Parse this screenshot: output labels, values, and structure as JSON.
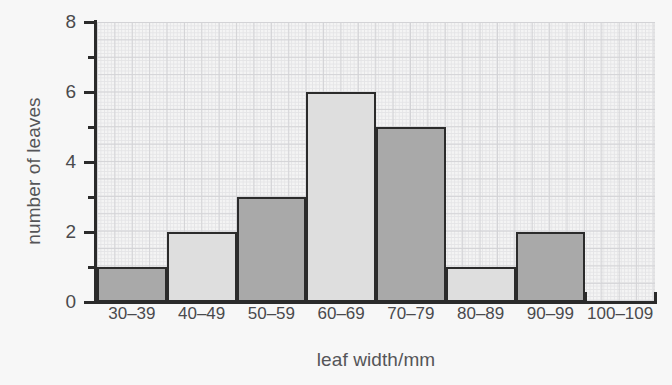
{
  "chart_data": {
    "type": "bar",
    "title": "",
    "subtitle": "",
    "xlabel": "leaf width/mm",
    "ylabel": "number of leaves",
    "categories": [
      "30–39",
      "40–49",
      "50–59",
      "60–69",
      "70–79",
      "80–89",
      "90–99",
      "100–109"
    ],
    "values": [
      1,
      2,
      3,
      6,
      5,
      1,
      2,
      0
    ],
    "bar_fills": [
      "dark",
      "light",
      "dark",
      "light",
      "dark",
      "light",
      "dark",
      "empty"
    ],
    "ylim": [
      0,
      8
    ],
    "y_ticks_major": [
      0,
      2,
      4,
      6,
      8
    ],
    "y_ticks_minor": [
      1,
      3,
      5,
      7
    ],
    "y_tick_labels": [
      "0",
      "2",
      "4",
      "6",
      "8"
    ],
    "grid": true,
    "grid_style": "graph-paper",
    "legend": "none",
    "colors": {
      "bar_dark": "#a9a9a9",
      "bar_light": "#dedede",
      "bar_outline": "#2b2b2b",
      "axis": "#2b2b2b",
      "text": "#4a4a4d",
      "axis_title_text": "#555558",
      "grid_major": "#d3d3d6",
      "grid_minor": "#e4e4e6",
      "plot_background": "#f4f4f4",
      "page_background": "#f7f7f7"
    }
  }
}
